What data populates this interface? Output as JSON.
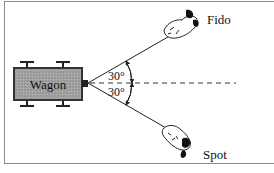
{
  "diagram": {
    "wagon": {
      "label": "Wagon",
      "fill": "#9c9c9c",
      "stroke": "#333333"
    },
    "dogs": [
      {
        "name": "Fido",
        "position": "upper-right"
      },
      {
        "name": "Spot",
        "position": "lower-right"
      }
    ],
    "angles": [
      {
        "label": "30°",
        "side": "upper"
      },
      {
        "label": "30°",
        "side": "lower"
      }
    ],
    "reference_line": "dashed horizontal",
    "colors": {
      "line": "#222222",
      "frame": "#8a8a8a",
      "background": "#ffffff"
    }
  }
}
